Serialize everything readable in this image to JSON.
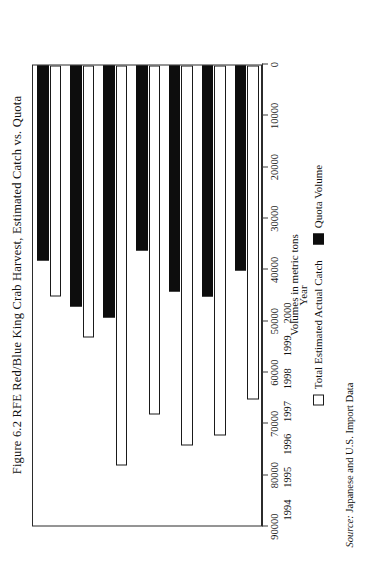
{
  "figure": {
    "title": "Figure 6.2 RFE Red/Blue King Crab Harvest, Estimated Catch vs. Quota",
    "source": "Source: Japanese and U.S. Import Data",
    "source_lead": "Source:",
    "source_rest": " Japanese and U.S. Import Data"
  },
  "legend": {
    "position": "bottom",
    "items": [
      {
        "label": "Total Estimated Actual Catch",
        "swatch": "white",
        "color": "#ffffff"
      },
      {
        "label": "Quota Volume",
        "swatch": "black",
        "color": "#0d0d0d"
      }
    ]
  },
  "axes": {
    "value_axis_title": "Volumes in metric tons",
    "category_axis_title": "Year",
    "value_ticks": [
      "90000",
      "80000",
      "70000",
      "60000",
      "50000",
      "40000",
      "30000",
      "20000",
      "10000",
      "0"
    ]
  },
  "chart_data": {
    "type": "bar",
    "orientation": "horizontal",
    "title": "Figure 6.2 RFE Red/Blue King Crab Harvest, Estimated Catch vs. Quota",
    "xlabel": "Year",
    "ylabel": "Volumes in metric tons",
    "ylim": [
      0,
      90000
    ],
    "ytick_step": 10000,
    "grid": false,
    "legend_position": "bottom",
    "categories": [
      "1994",
      "1995",
      "1996",
      "1997",
      "1998",
      "1999",
      "2000"
    ],
    "series": [
      {
        "name": "Total Estimated Actual Catch",
        "color": "#ffffff",
        "values": [
          45000,
          53000,
          78000,
          68000,
          74000,
          72000,
          65000
        ]
      },
      {
        "name": "Quota Volume",
        "color": "#0d0d0d",
        "values": [
          38000,
          47000,
          49000,
          36000,
          44000,
          45000,
          40000
        ]
      }
    ]
  }
}
